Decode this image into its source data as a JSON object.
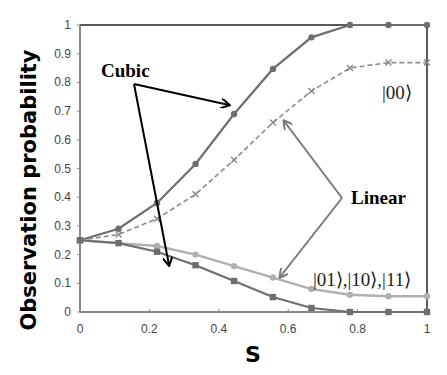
{
  "chart_data": {
    "type": "line",
    "title": "",
    "xlabel": "S",
    "ylabel": "Observation probability",
    "xlim": [
      0,
      1
    ],
    "ylim": [
      0,
      1
    ],
    "x_ticks": [
      "0",
      "0.2",
      "0.4",
      "0.6",
      "0.8",
      "1"
    ],
    "y_ticks": [
      "0",
      "0.1",
      "0.2",
      "0.3",
      "0.4",
      "0.5",
      "0.6",
      "0.7",
      "0.8",
      "0.9",
      "1"
    ],
    "x": [
      0,
      0.111,
      0.222,
      0.333,
      0.444,
      0.556,
      0.667,
      0.778,
      0.889,
      1
    ],
    "series": [
      {
        "name": "Cubic |00⟩",
        "style": "solid-dark",
        "marker": "circle",
        "values": [
          0.25,
          0.29,
          0.38,
          0.516,
          0.69,
          0.847,
          0.957,
          1.0,
          1.0,
          1.0
        ]
      },
      {
        "name": "Linear |00⟩",
        "style": "dashed",
        "marker": "x",
        "values": [
          0.25,
          0.27,
          0.325,
          0.41,
          0.53,
          0.66,
          0.77,
          0.85,
          0.869,
          0.869
        ]
      },
      {
        "name": "Linear |01⟩,|10⟩,|11⟩",
        "style": "solid-light",
        "marker": "circle",
        "values": [
          0.25,
          0.24,
          0.23,
          0.2,
          0.16,
          0.12,
          0.08,
          0.06,
          0.055,
          0.055
        ]
      },
      {
        "name": "Cubic |01⟩,|10⟩,|11⟩",
        "style": "solid-dark",
        "marker": "square",
        "values": [
          0.25,
          0.24,
          0.21,
          0.163,
          0.108,
          0.052,
          0.014,
          0.0,
          0.0,
          0.0
        ]
      }
    ],
    "annotations": [
      {
        "text": "Cubic",
        "points_to": [
          "Cubic |00⟩",
          "Cubic |01⟩,|10⟩,|11⟩"
        ]
      },
      {
        "text": "Linear",
        "points_to": [
          "Linear |00⟩",
          "Linear |01⟩,|10⟩,|11⟩"
        ]
      },
      {
        "text": "|00⟩",
        "labels": "upper curves"
      },
      {
        "text": "|01⟩,|10⟩,|11⟩",
        "labels": "lower curves"
      }
    ],
    "grid": false,
    "legend": "none"
  },
  "colors": {
    "dark_series": "#6e6e6e",
    "dashed_series": "#8a8a8a",
    "light_series": "#b0b0b0",
    "arrow_dark": "#000000",
    "arrow_light": "#7a7a7a"
  }
}
